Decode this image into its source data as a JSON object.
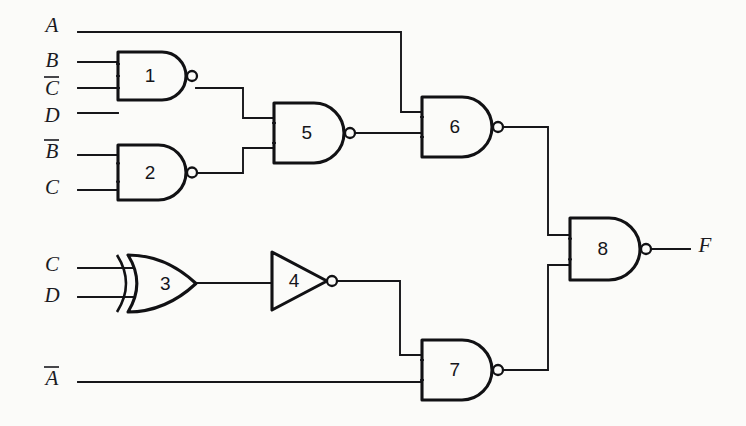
{
  "diagram": {
    "background_color": "#fbfbf9",
    "line_color": "#16161a"
  },
  "inputs": [
    {
      "id": "in-a",
      "label": "A",
      "overbar": false,
      "x": 52,
      "y": 32,
      "wire_y": 32
    },
    {
      "id": "in-b",
      "label": "B",
      "overbar": false,
      "x": 52,
      "y": 67,
      "wire_y": 62
    },
    {
      "id": "in-cbar",
      "label": "C",
      "overbar": true,
      "x": 52,
      "y": 95,
      "wire_y": 88
    },
    {
      "id": "in-d",
      "label": "D",
      "overbar": false,
      "x": 52,
      "y": 122,
      "wire_y": 113
    },
    {
      "id": "in-bbar",
      "label": "B",
      "overbar": true,
      "x": 52,
      "y": 158,
      "wire_y": 155
    },
    {
      "id": "in-c2",
      "label": "C",
      "overbar": false,
      "x": 52,
      "y": 194,
      "wire_y": 190
    },
    {
      "id": "in-c3",
      "label": "C",
      "overbar": false,
      "x": 52,
      "y": 271,
      "wire_y": 268
    },
    {
      "id": "in-d2",
      "label": "D",
      "overbar": false,
      "x": 52,
      "y": 302,
      "wire_y": 297
    },
    {
      "id": "in-abar",
      "label": "A",
      "overbar": true,
      "x": 52,
      "y": 385,
      "wire_y": 382
    }
  ],
  "outputs": [
    {
      "id": "out-f",
      "label": "F",
      "overbar": false,
      "x": 705,
      "y": 252
    }
  ],
  "gates": [
    {
      "id": "gate-1",
      "number": "1",
      "type": "nand",
      "inputs": 3,
      "x": 118,
      "y": 52,
      "w": 68,
      "h": 48
    },
    {
      "id": "gate-2",
      "number": "2",
      "type": "nand",
      "inputs": 2,
      "x": 118,
      "y": 145,
      "w": 68,
      "h": 55
    },
    {
      "id": "gate-3",
      "number": "3",
      "type": "xor",
      "inputs": 2,
      "x": 128,
      "y": 255,
      "w": 68,
      "h": 57
    },
    {
      "id": "gate-4",
      "number": "4",
      "type": "inverter",
      "inputs": 1,
      "x": 272,
      "y": 252,
      "w": 55,
      "h": 58
    },
    {
      "id": "gate-5",
      "number": "5",
      "type": "nand",
      "inputs": 2,
      "x": 274,
      "y": 103,
      "w": 70,
      "h": 60
    },
    {
      "id": "gate-6",
      "number": "6",
      "type": "nand",
      "inputs": 2,
      "x": 422,
      "y": 97,
      "w": 70,
      "h": 60
    },
    {
      "id": "gate-7",
      "number": "7",
      "type": "nand",
      "inputs": 2,
      "x": 422,
      "y": 340,
      "w": 70,
      "h": 60
    },
    {
      "id": "gate-8",
      "number": "8",
      "type": "nand",
      "inputs": 2,
      "x": 570,
      "y": 218,
      "w": 70,
      "h": 62
    }
  ],
  "nets": [
    {
      "id": "net-a-to-gate6",
      "from": "in-a",
      "to": "gate-6",
      "path": "M 78 32 L 401 32 L 401 112 L 422 112"
    },
    {
      "id": "net-b-to-gate1",
      "from": "in-b",
      "to": "gate-1",
      "path": "M 78 62 L 118 62"
    },
    {
      "id": "net-cbar-to-g1",
      "from": "in-cbar",
      "to": "gate-1",
      "path": "M 78 88 L 118 88"
    },
    {
      "id": "net-d-to-gate1",
      "from": "in-d",
      "to": "gate-1",
      "path": "M 78 113 L 118 113"
    },
    {
      "id": "net-bbar-to-g2",
      "from": "in-bbar",
      "to": "gate-2",
      "path": "M 78 155 L 118 155"
    },
    {
      "id": "net-c-to-gate2",
      "from": "in-c2",
      "to": "gate-2",
      "path": "M 78 190 L 118 190"
    },
    {
      "id": "net-g1-to-g5",
      "from": "gate-1",
      "to": "gate-5",
      "path": "M 196 88 L 243 88 L 243 118 L 274 118"
    },
    {
      "id": "net-g2-to-g5",
      "from": "gate-2",
      "to": "gate-5",
      "path": "M 196 173 L 243 173 L 243 148 L 274 148"
    },
    {
      "id": "net-g5-to-g6",
      "from": "gate-5",
      "to": "gate-6",
      "path": "M 354 133 L 422 133"
    },
    {
      "id": "net-c-to-gate3",
      "from": "in-c3",
      "to": "gate-3",
      "path": "M 78 268 L 146 268"
    },
    {
      "id": "net-d-to-gate3",
      "from": "in-d2",
      "to": "gate-3",
      "path": "M 78 297 L 146 297"
    },
    {
      "id": "net-g3-to-g4",
      "from": "gate-3",
      "to": "gate-4",
      "path": "M 196 283 L 272 283"
    },
    {
      "id": "net-g4-to-g7",
      "from": "gate-4",
      "to": "gate-7",
      "path": "M 337 281 L 400 281 L 400 355 L 422 355"
    },
    {
      "id": "net-abar-to-g7",
      "from": "in-abar",
      "to": "gate-7",
      "path": "M 78 382 L 422 382"
    },
    {
      "id": "net-g6-to-g8",
      "from": "gate-6",
      "to": "gate-8",
      "path": "M 502 127 L 548 127 L 548 235 L 570 235"
    },
    {
      "id": "net-g7-to-g8",
      "from": "gate-7",
      "to": "gate-8",
      "path": "M 502 370 L 548 370 L 548 265 L 570 265"
    },
    {
      "id": "net-g8-to-f",
      "from": "gate-8",
      "to": "out-f",
      "path": "M 650 249 L 690 249"
    }
  ]
}
